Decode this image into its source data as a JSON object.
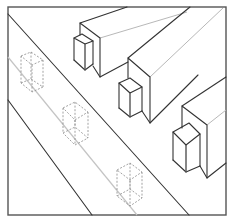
{
  "figure": {
    "colors": {
      "background": "#ffffff",
      "frame": "#555555",
      "ink": "#333333",
      "light_line": "#b8b8b8",
      "dashed": "#8a8a8a"
    },
    "frame": {
      "x": 8,
      "y": 7,
      "width": 218,
      "height": 208
    },
    "road_lines": [
      {
        "name": "road-edge-upper",
        "x1": 8,
        "y1": 14,
        "x2": 189,
        "y2": 215,
        "style": "dark"
      },
      {
        "name": "road-centerline",
        "x1": 8,
        "y1": 57,
        "x2": 137,
        "y2": 215,
        "style": "light"
      },
      {
        "name": "road-edge-lower",
        "x1": 8,
        "y1": 100,
        "x2": 92,
        "y2": 215,
        "style": "dark"
      }
    ],
    "buildings": [
      {
        "name": "building-1",
        "dark_lines": [
          [
            [
              80,
              35
            ],
            [
              80,
              23
            ],
            [
              100,
              38
            ],
            [
              100,
              77
            ]
          ],
          [
            [
              80,
              23
            ],
            [
              127,
              7
            ]
          ],
          [
            [
              93,
              66
            ],
            [
              100,
              77
            ],
            [
              128,
              62
            ]
          ]
        ],
        "light_lines": [
          [
            [
              100,
              38
            ],
            [
              187,
              12
            ]
          ]
        ],
        "annex": {
          "top": [
            [
              74,
              38
            ],
            [
              82,
              34
            ],
            [
              93,
              41
            ],
            [
              85,
              44
            ]
          ],
          "verticals": [
            [
              [
                74,
                38
              ],
              [
                74,
                60
              ]
            ],
            [
              [
                85,
                44
              ],
              [
                85,
                70
              ]
            ],
            [
              [
                93,
                41
              ],
              [
                93,
                64
              ]
            ]
          ],
          "bottom": [
            [
              74,
              60
            ],
            [
              85,
              70
            ],
            [
              93,
              64
            ]
          ]
        }
      },
      {
        "name": "building-2",
        "dark_lines": [
          [
            [
              128,
              78
            ],
            [
              128,
              58
            ],
            [
              150,
              77
            ],
            [
              150,
              123
            ]
          ],
          [
            [
              128,
              58
            ],
            [
              190,
              7
            ]
          ],
          [
            [
              142,
              111
            ],
            [
              150,
              123
            ],
            [
              198,
              75
            ]
          ]
        ],
        "light_lines": [
          [
            [
              150,
              77
            ],
            [
              223,
              8
            ]
          ]
        ],
        "annex": {
          "top": [
            [
              119,
              83
            ],
            [
              130,
              78
            ],
            [
              142,
              87
            ],
            [
              130,
              93
            ]
          ],
          "verticals": [
            [
              [
                119,
                83
              ],
              [
                119,
                108
              ]
            ],
            [
              [
                130,
                93
              ],
              [
                130,
                117
              ]
            ],
            [
              [
                142,
                87
              ],
              [
                142,
                111
              ]
            ]
          ],
          "bottom": [
            [
              119,
              108
            ],
            [
              130,
              117
            ],
            [
              142,
              111
            ]
          ]
        }
      },
      {
        "name": "building-3",
        "dark_lines": [
          [
            [
              182,
              128
            ],
            [
              182,
              106
            ],
            [
              207,
              125
            ],
            [
              207,
              178
            ]
          ],
          [
            [
              182,
              106
            ],
            [
              226,
              77
            ]
          ],
          [
            [
              200,
              166
            ],
            [
              207,
              178
            ],
            [
              226,
              163
            ]
          ]
        ],
        "light_lines": [
          [
            [
              207,
              125
            ],
            [
              226,
              110
            ]
          ]
        ],
        "annex": {
          "top": [
            [
              173,
              132
            ],
            [
              189,
              123
            ],
            [
              200,
              134
            ],
            [
              186,
              145
            ]
          ],
          "verticals": [
            [
              [
                173,
                132
              ],
              [
                173,
                160
              ]
            ],
            [
              [
                186,
                145
              ],
              [
                186,
                172
              ]
            ],
            [
              [
                200,
                134
              ],
              [
                200,
                166
              ]
            ]
          ],
          "bottom": [
            [
              173,
              160
            ],
            [
              186,
              172
            ],
            [
              200,
              166
            ]
          ]
        }
      }
    ],
    "dashed_boxes": [
      {
        "name": "dashed-box-1",
        "top": [
          [
            21,
            56
          ],
          [
            31,
            52
          ],
          [
            43,
            60
          ],
          [
            32,
            65
          ]
        ],
        "bottom": [
          [
            21,
            83
          ],
          [
            31,
            79
          ],
          [
            43,
            87
          ],
          [
            32,
            92
          ]
        ]
      },
      {
        "name": "dashed-box-2",
        "top": [
          [
            63,
            108
          ],
          [
            75,
            102
          ],
          [
            88,
            112
          ],
          [
            75,
            120
          ]
        ],
        "bottom": [
          [
            63,
            133
          ],
          [
            75,
            127
          ],
          [
            88,
            138
          ],
          [
            75,
            145
          ]
        ]
      },
      {
        "name": "dashed-box-3",
        "top": [
          [
            117,
            170
          ],
          [
            130,
            163
          ],
          [
            142,
            172
          ],
          [
            130,
            180
          ]
        ],
        "bottom": [
          [
            117,
            196
          ],
          [
            130,
            189
          ],
          [
            142,
            198
          ],
          [
            130,
            206
          ]
        ]
      }
    ]
  }
}
